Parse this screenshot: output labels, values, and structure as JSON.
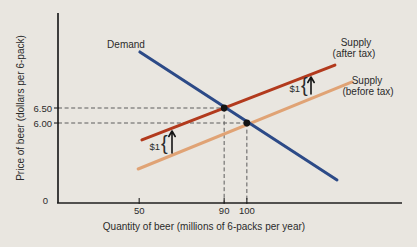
{
  "figure": {
    "bg": "#e9e6e0",
    "axis_color": "#1f1f1f",
    "dash_color": "#5c5c5c",
    "dot_color": "#141414",
    "text_color": "#2b2b2b"
  },
  "chart_data": {
    "type": "line",
    "xlabel": "Quantity of beer (millions of 6-packs per year)",
    "ylabel": "Price of beer (dollars per 6-pack)",
    "origin_label": "0",
    "x_ticks": [
      {
        "label": "50",
        "f": 0.236
      },
      {
        "label": "90",
        "f": 0.483
      },
      {
        "label": "100",
        "f": 0.549
      }
    ],
    "y_ticks": [
      {
        "label": "6.50",
        "f": 0.5
      },
      {
        "label": "6.00",
        "f": 0.579
      }
    ],
    "series": [
      {
        "id": "demand",
        "label": "Demand",
        "color": "#2c4a87",
        "passes_through_q_p": [
          [
            90,
            6.5
          ],
          [
            100,
            6.0
          ]
        ],
        "frac": [
          0.238,
          0.205,
          0.811,
          0.879
        ]
      },
      {
        "id": "supply-after-tax",
        "label": "Supply",
        "label2": "(after tax)",
        "color": "#b23a1d",
        "passes_through_q_p": [
          [
            90,
            6.5
          ]
        ],
        "frac": [
          0.244,
          0.668,
          0.805,
          0.274
        ]
      },
      {
        "id": "supply-before-tax",
        "label": "Supply",
        "label2": "(before tax)",
        "color": "#e0a375",
        "passes_through_q_p": [
          [
            100,
            6.0
          ]
        ],
        "frac": [
          0.233,
          0.821,
          0.855,
          0.363
        ]
      }
    ],
    "points": [
      {
        "id": "after-tax",
        "quantity": 90,
        "price": 6.5,
        "fx": 0.483,
        "fy": 0.5
      },
      {
        "id": "before-tax",
        "quantity": 100,
        "price": 6.0,
        "fx": 0.549,
        "fy": 0.579
      }
    ],
    "tax_shift": {
      "label": "$1",
      "brace": "{",
      "amount_dollars": 1
    },
    "layout": {
      "plot": {
        "left": 58,
        "top": 13,
        "right": 402,
        "bottom": 203
      },
      "demand_label": {
        "x": 126,
        "y": 48
      },
      "supply_after_label1": {
        "x": 356,
        "y": 46
      },
      "supply_after_label2": {
        "x": 354,
        "y": 57
      },
      "supply_before_label1": {
        "x": 367,
        "y": 84
      },
      "supply_before_label2": {
        "x": 368,
        "y": 95
      },
      "x_axis_title": {
        "x": 204,
        "y": 230
      },
      "y_axis_title": {
        "x": 24,
        "y": 108
      },
      "tax_left": {
        "text_x": 160,
        "text_y": 150,
        "brace_x": 161,
        "brace_y": 150,
        "arrow_x": 172,
        "arrow_top": 131,
        "arrow_bottom": 153
      },
      "tax_right": {
        "text_x": 300,
        "text_y": 92,
        "brace_x": 301,
        "brace_y": 92,
        "arrow_x": 311,
        "arrow_top": 77,
        "arrow_bottom": 94
      }
    }
  }
}
